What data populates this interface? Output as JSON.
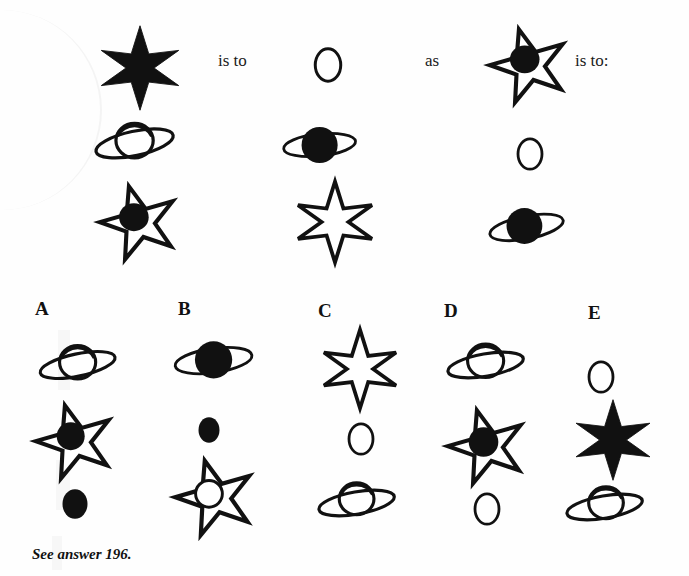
{
  "page": {
    "type": "visual-analogy-puzzle",
    "background_color": "#fefefe",
    "ink_color": "#111111"
  },
  "prompt": {
    "connector_1": "is to",
    "connector_2": "as",
    "connector_3": "is to:"
  },
  "footnote": {
    "text": "See answer 196."
  },
  "stem": {
    "columns": [
      {
        "name": "column-1",
        "items": [
          {
            "shape": "six-point-star-filled"
          },
          {
            "shape": "saturn-open"
          },
          {
            "shape": "five-point-star-with-filled-dot"
          }
        ]
      },
      {
        "name": "column-2",
        "items": [
          {
            "shape": "circle-open"
          },
          {
            "shape": "saturn-filled"
          },
          {
            "shape": "six-point-star-open"
          }
        ]
      },
      {
        "name": "column-3",
        "items": [
          {
            "shape": "five-point-star-with-filled-dot"
          },
          {
            "shape": "circle-open"
          },
          {
            "shape": "saturn-filled"
          }
        ]
      }
    ]
  },
  "options": [
    {
      "label": "A",
      "items": [
        {
          "shape": "saturn-open"
        },
        {
          "shape": "five-point-star-with-filled-dot"
        },
        {
          "shape": "circle-filled"
        }
      ]
    },
    {
      "label": "B",
      "items": [
        {
          "shape": "saturn-filled"
        },
        {
          "shape": "circle-filled-small"
        },
        {
          "shape": "five-point-star-with-open-circle"
        }
      ]
    },
    {
      "label": "C",
      "items": [
        {
          "shape": "six-point-star-open"
        },
        {
          "shape": "circle-open"
        },
        {
          "shape": "saturn-open"
        }
      ]
    },
    {
      "label": "D",
      "items": [
        {
          "shape": "saturn-open"
        },
        {
          "shape": "five-point-star-with-filled-dot"
        },
        {
          "shape": "circle-open"
        }
      ]
    },
    {
      "label": "E",
      "items": [
        {
          "shape": "circle-open"
        },
        {
          "shape": "six-point-star-filled"
        },
        {
          "shape": "saturn-open"
        }
      ]
    }
  ]
}
